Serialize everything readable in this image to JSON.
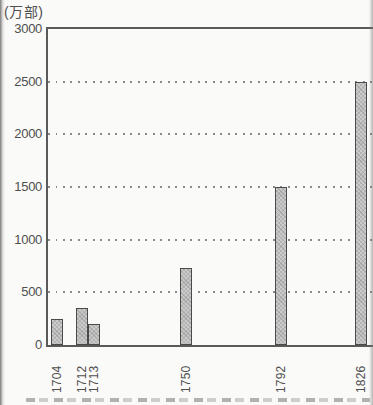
{
  "chart_data": {
    "type": "bar",
    "title": "",
    "ylabel": "(万部)",
    "xlabel": "",
    "categories": [
      "1704",
      "1712",
      "1713",
      "1750",
      "1792",
      "1826"
    ],
    "values": [
      250,
      350,
      200,
      730,
      1500,
      2500
    ],
    "ylim": [
      0,
      3000
    ],
    "yticks": [
      3000,
      2500,
      2000,
      1500,
      1000,
      500,
      0
    ],
    "grid": "horizontal-dotted",
    "legend": "none",
    "x_tick_rotation_deg": -90,
    "layout": {
      "plot_px": {
        "left": 48,
        "top": 29,
        "right": 373,
        "bottom": 345
      },
      "bar_width_px": 12,
      "bar_center_x_px": [
        57,
        82,
        94,
        186,
        281,
        361
      ]
    },
    "colors": {
      "bar_fill": "#cbcbcb",
      "bar_border": "#4a4a4a",
      "axis": "#5a5a5a",
      "grid_dots": "#8a8a8a",
      "tick_label": "#4f4f4f",
      "background": "#fafaf8"
    }
  }
}
